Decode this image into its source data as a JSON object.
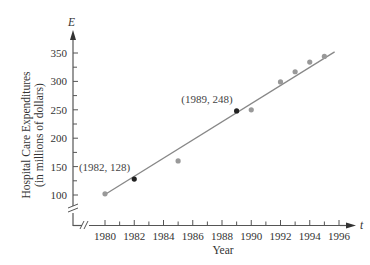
{
  "chart_data": {
    "type": "scatter",
    "title": "",
    "xlabel": "Year",
    "ylabel": "Hospital Care Expenditures (in millions of dollars)",
    "ylabel_line1": "Hospital Care Expenditures",
    "ylabel_line2": "(in millions of dollars)",
    "x_axis_var": "t",
    "y_axis_var": "E",
    "xlim": [
      1978,
      1997
    ],
    "ylim": [
      50,
      375
    ],
    "x_ticks": [
      1980,
      1982,
      1984,
      1986,
      1988,
      1990,
      1992,
      1994,
      1996
    ],
    "x_minor_ticks": [
      1981,
      1983,
      1985,
      1987,
      1989,
      1991,
      1993,
      1995
    ],
    "y_ticks": [
      100,
      150,
      200,
      250,
      300,
      350
    ],
    "y_minor_ticks": [
      125,
      175,
      225,
      275,
      325
    ],
    "axis_breaks": true,
    "grid": false,
    "legend": null,
    "series": [
      {
        "name": "Observed data",
        "type": "scatter",
        "color": "#999999",
        "x": [
          1980,
          1985,
          1990,
          1992,
          1993,
          1994,
          1995
        ],
        "y": [
          102,
          160,
          250,
          299,
          317,
          334,
          344
        ]
      },
      {
        "name": "Highlighted points",
        "type": "scatter",
        "color": "#222222",
        "x": [
          1982,
          1989
        ],
        "y": [
          128,
          248
        ]
      },
      {
        "name": "Linear model",
        "type": "line",
        "color": "#888888",
        "x": [
          1980,
          1995.7
        ],
        "y": [
          101,
          352
        ]
      }
    ],
    "annotations": [
      {
        "text": "(1982, 128)",
        "x": 1982,
        "y": 128
      },
      {
        "text": "(1989, 248)",
        "x": 1989,
        "y": 248
      }
    ]
  }
}
